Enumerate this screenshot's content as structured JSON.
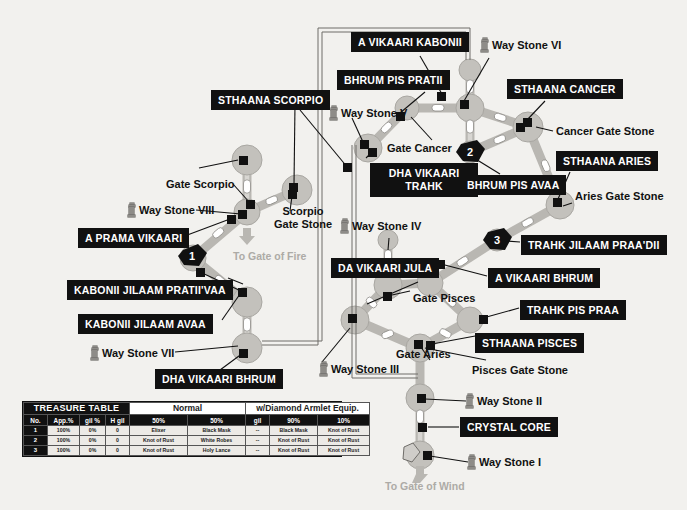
{
  "map": {
    "title": "Giruvegan map",
    "directions": [
      {
        "id": "to-gate-of-fire",
        "text": "To Gate of Fire"
      },
      {
        "id": "to-gate-of-wind",
        "text": "To Gate of Wind"
      }
    ],
    "numbered_markers": [
      {
        "id": "marker-1",
        "number": "1"
      },
      {
        "id": "marker-2",
        "number": "2"
      },
      {
        "id": "marker-3",
        "number": "3"
      }
    ],
    "black_labels": [
      {
        "id": "sthaana-scorpio",
        "text": "STHAANA SCORPIO"
      },
      {
        "id": "a-prama-vikaari",
        "text": "A PRAMA VIKAARI"
      },
      {
        "id": "kabonii-jilaam-pratiivaa",
        "text": "KABONII JILAAM PRATII'VAA"
      },
      {
        "id": "kabonii-jilaam-avaa",
        "text": "KABONII JILAAM AVAA"
      },
      {
        "id": "dha-vikaari-bhrum",
        "text": "DHA VIKAARI BHRUM"
      },
      {
        "id": "a-vikaari-kabonii",
        "text": "A VIKAARI KABONII"
      },
      {
        "id": "bhrum-pis-pratii",
        "text": "BHRUM PIS PRATII"
      },
      {
        "id": "sthaana-cancer",
        "text": "STHAANA CANCER"
      },
      {
        "id": "dha-vikaari-trahk",
        "text": "DHA VIKAARI TRAHK"
      },
      {
        "id": "bhrum-pis-avaa",
        "text": "BHRUM PIS AVAA"
      },
      {
        "id": "sthaana-aries",
        "text": "STHAANA ARIES"
      },
      {
        "id": "trahk-jilaam-praadii",
        "text": "TRAHK JILAAM PRAA'DII"
      },
      {
        "id": "a-vikaari-bhrum",
        "text": "A VIKAARI BHRUM"
      },
      {
        "id": "trahk-pis-praa",
        "text": "TRAHK PIS PRAA"
      },
      {
        "id": "da-vikaari-jula",
        "text": "DA VIKAARI JULA"
      },
      {
        "id": "sthaana-pisces",
        "text": "STHAANA PISCES"
      },
      {
        "id": "crystal-core",
        "text": "CRYSTAL CORE"
      }
    ],
    "plain_labels": [
      {
        "id": "gate-scorpio",
        "text": "Gate Scorpio"
      },
      {
        "id": "scorpio-gate-stone",
        "text": "Scorpio\nGate Stone"
      },
      {
        "id": "gate-cancer",
        "text": "Gate Cancer"
      },
      {
        "id": "cancer-gate-stone",
        "text": "Cancer Gate Stone"
      },
      {
        "id": "aries-gate-stone",
        "text": "Aries Gate Stone"
      },
      {
        "id": "gate-pisces",
        "text": "Gate Pisces"
      },
      {
        "id": "gate-aries",
        "text": "Gate Aries"
      },
      {
        "id": "pisces-gate-stone",
        "text": "Pisces Gate Stone"
      }
    ],
    "way_stones": [
      {
        "id": "way-stone-1",
        "text": "Way Stone I"
      },
      {
        "id": "way-stone-2",
        "text": "Way Stone II"
      },
      {
        "id": "way-stone-3",
        "text": "Way Stone III"
      },
      {
        "id": "way-stone-4",
        "text": "Way Stone IV"
      },
      {
        "id": "way-stone-5",
        "text": "Way Stone V"
      },
      {
        "id": "way-stone-6",
        "text": "Way Stone VI"
      },
      {
        "id": "way-stone-7",
        "text": "Way Stone VII"
      },
      {
        "id": "way-stone-8",
        "text": "Way Stone VIII"
      }
    ]
  },
  "treasure_table": {
    "title": "TREASURE TABLE",
    "group_normal": "Normal",
    "group_diamond": "w/Diamond Armlet Equip.",
    "columns": [
      "No.",
      "App.%",
      "gil %",
      "H gil",
      "50%",
      "50%",
      "gil",
      "90%",
      "10%"
    ],
    "rows": [
      {
        "no": "1",
        "app": "100%",
        "gilpct": "0%",
        "hgil": "0",
        "n50a": "Elixer",
        "n50b": "Black Mask",
        "dgil": "--",
        "d90": "Black Mask",
        "d10": "Knot of Rust"
      },
      {
        "no": "2",
        "app": "100%",
        "gilpct": "0%",
        "hgil": "0",
        "n50a": "Knot of Rust",
        "n50b": "White Robes",
        "dgil": "--",
        "d90": "Knot of Rust",
        "d10": "Knot of Rust"
      },
      {
        "no": "3",
        "app": "100%",
        "gilpct": "0%",
        "hgil": "0",
        "n50a": "Knot of Rust",
        "n50b": "Holy Lance",
        "dgil": "--",
        "d90": "Knot of Rust",
        "d10": "Knot of Rust"
      }
    ]
  },
  "colors": {
    "background": "#f2f1ee",
    "label_bg": "#111111",
    "label_fg": "#ffffff",
    "path": "#b9b7b2",
    "node": "#c3c1bc",
    "dim_text": "#adaba6"
  }
}
